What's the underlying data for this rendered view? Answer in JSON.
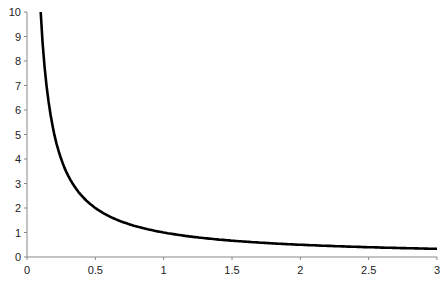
{
  "chart_data": {
    "type": "line",
    "title": "",
    "xlabel": "",
    "ylabel": "",
    "xlim": [
      0,
      3
    ],
    "ylim": [
      0,
      10
    ],
    "grid": false,
    "legend": null,
    "x_ticks": [
      "0",
      "0.5",
      "1",
      "1.5",
      "2",
      "2.5",
      "3"
    ],
    "y_ticks": [
      "0",
      "1",
      "2",
      "3",
      "4",
      "5",
      "6",
      "7",
      "8",
      "9",
      "10"
    ],
    "series": [
      {
        "name": "y = 1/x",
        "color": "#000000",
        "x": [
          0.1,
          0.125,
          0.15,
          0.2,
          0.25,
          0.3,
          0.4,
          0.5,
          0.6,
          0.75,
          1,
          1.25,
          1.5,
          1.75,
          2,
          2.25,
          2.5,
          2.75,
          3
        ],
        "values": [
          10,
          8,
          6.67,
          5,
          4,
          3.33,
          2.5,
          2,
          1.67,
          1.33,
          1,
          0.8,
          0.67,
          0.57,
          0.5,
          0.44,
          0.4,
          0.36,
          0.33
        ]
      }
    ]
  }
}
